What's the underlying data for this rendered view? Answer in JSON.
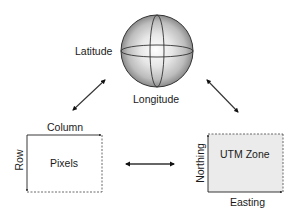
{
  "diagram": {
    "globe": {
      "latitude_label": "Latitude",
      "longitude_label": "Longitude"
    },
    "pixel_space": {
      "center_label": "Pixels",
      "horizontal_axis_label": "Column",
      "vertical_axis_label": "Row"
    },
    "utm_space": {
      "center_label": "UTM Zone",
      "horizontal_axis_label": "Easting",
      "vertical_axis_label": "Northing"
    },
    "arrows": [
      {
        "from": "globe",
        "to": "pixel_space",
        "type": "bidirectional"
      },
      {
        "from": "globe",
        "to": "utm_space",
        "type": "bidirectional"
      },
      {
        "from": "pixel_space",
        "to": "utm_space",
        "type": "bidirectional"
      }
    ],
    "colors": {
      "line": "#222222",
      "utm_fill": "#ebebeb",
      "globe_light": "#ffffff",
      "globe_dark": "#8a8a8a"
    }
  }
}
